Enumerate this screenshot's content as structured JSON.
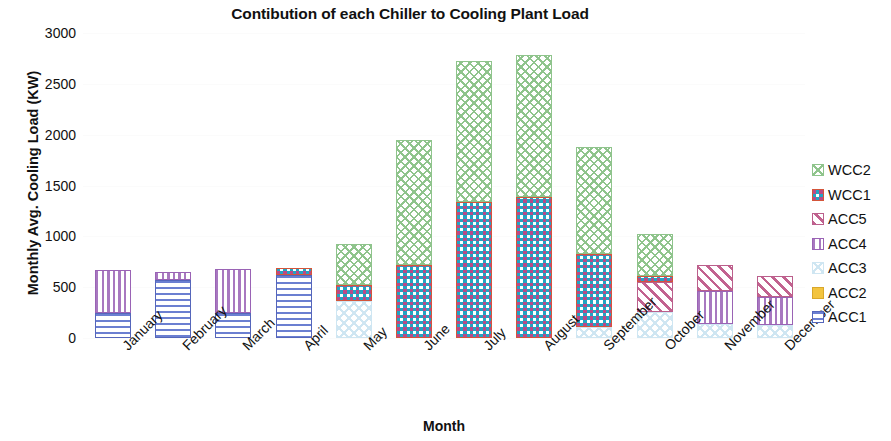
{
  "chart_data": {
    "type": "bar",
    "stacked": true,
    "title": "Contibution of each Chiller to Cooling Plant Load",
    "xlabel": "Month",
    "ylabel": "Monthly Avg. Cooling Load (KW)",
    "categories": [
      "January",
      "February",
      "March",
      "April",
      "May",
      "June",
      "July",
      "August",
      "September",
      "October",
      "November",
      "December"
    ],
    "yticks": [
      "0",
      "500",
      "1000",
      "1500",
      "2000",
      "2500",
      "3000"
    ],
    "ytick_values": [
      0,
      500,
      1000,
      1500,
      2000,
      2500,
      3000
    ],
    "ylim": [
      0,
      3000
    ],
    "grid": true,
    "legend_position": "right",
    "series": [
      {
        "name": "ACC1",
        "color": "#6b7fd1",
        "pattern": "horizontal-lines",
        "values": [
          250,
          575,
          250,
          620,
          0,
          0,
          0,
          0,
          0,
          0,
          0,
          0
        ]
      },
      {
        "name": "ACC2",
        "color": "#f3c43f",
        "pattern": "solid",
        "values": [
          0,
          0,
          0,
          0,
          0,
          0,
          0,
          0,
          0,
          0,
          0,
          0
        ]
      },
      {
        "name": "ACC3",
        "color": "#cfe6f2",
        "pattern": "dotted",
        "values": [
          0,
          0,
          0,
          0,
          360,
          0,
          0,
          0,
          110,
          260,
          135,
          130
        ]
      },
      {
        "name": "ACC4",
        "color": "#a878c0",
        "pattern": "vertical-lines",
        "values": [
          415,
          70,
          425,
          0,
          0,
          0,
          0,
          0,
          0,
          0,
          330,
          270
        ]
      },
      {
        "name": "ACC5",
        "color": "#c2628f",
        "pattern": "diagonal-lines",
        "values": [
          0,
          0,
          0,
          0,
          0,
          0,
          0,
          0,
          0,
          290,
          250,
          205
        ]
      },
      {
        "name": "WCC1",
        "color": "#dd5b3c",
        "pattern": "checker",
        "values": [
          0,
          0,
          0,
          65,
          160,
          715,
          1340,
          1390,
          715,
          60,
          0,
          0
        ]
      },
      {
        "name": "WCC2",
        "color": "#8fc48c",
        "pattern": "crosshatch",
        "values": [
          0,
          0,
          0,
          0,
          405,
          1235,
          1380,
          1390,
          1050,
          410,
          0,
          0
        ]
      }
    ],
    "totals": [
      665,
      645,
      675,
      685,
      925,
      1950,
      2720,
      2780,
      1875,
      1020,
      715,
      605
    ]
  },
  "legend": {
    "items": [
      {
        "label": "WCC2",
        "series": "WCC2"
      },
      {
        "label": "WCC1",
        "series": "WCC1"
      },
      {
        "label": "ACC5",
        "series": "ACC5"
      },
      {
        "label": "ACC4",
        "series": "ACC4"
      },
      {
        "label": "ACC3",
        "series": "ACC3"
      },
      {
        "label": "ACC2",
        "series": "ACC2"
      },
      {
        "label": "ACC1",
        "series": "ACC1"
      }
    ]
  }
}
